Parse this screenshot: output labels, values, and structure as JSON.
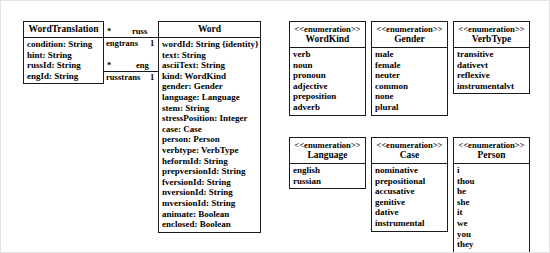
{
  "diagram": {
    "classes": [
      {
        "key": "word_translation",
        "name": "WordTranslation",
        "stereotype": "",
        "attributes": [
          "condition: String",
          "hint: String",
          "russId: String",
          "engId: String"
        ]
      },
      {
        "key": "word",
        "name": "Word",
        "stereotype": "",
        "attributes": [
          "wordId: String {identity}",
          "text: String",
          "asciiText: String",
          "kind: WordKind",
          "gender: Gender",
          "language: Language",
          "stem: String",
          "stressPosition: Integer",
          "case: Case",
          "person: Person",
          "verbtype: VerbType",
          "heformId: String",
          "prepversionId: String",
          "fversionId: String",
          "nversionId: String",
          "mversionId: String",
          "animate: Boolean",
          "enclosed: Boolean"
        ]
      }
    ],
    "enumerations": [
      {
        "key": "wordkind",
        "stereotype": "<<enumeration>>",
        "name": "WordKind",
        "literals": [
          "verb",
          "noun",
          "pronoun",
          "adjective",
          "preposition",
          "adverb"
        ]
      },
      {
        "key": "gender",
        "stereotype": "<<enumeration>>",
        "name": "Gender",
        "literals": [
          "male",
          "female",
          "neuter",
          "common",
          "none",
          "plural"
        ]
      },
      {
        "key": "verbtype",
        "stereotype": "<<enumeration>>",
        "name": "VerbType",
        "literals": [
          "transitive",
          "dativevt",
          "reflexive",
          "instrumentalvt"
        ]
      },
      {
        "key": "language",
        "stereotype": "<<enumeration>>",
        "name": "Language",
        "literals": [
          "english",
          "russian"
        ]
      },
      {
        "key": "case",
        "stereotype": "<<enumeration>>",
        "name": "Case",
        "literals": [
          "nominative",
          "prepositional",
          "accusative",
          "genitive",
          "dative",
          "instrumental"
        ]
      },
      {
        "key": "person",
        "stereotype": "<<enumeration>>",
        "name": "Person",
        "literals": [
          "i",
          "thou",
          "he",
          "she",
          "it",
          "we",
          "you",
          "they"
        ]
      }
    ],
    "associations": [
      {
        "key": "engtrans",
        "source_multiplicity": "*",
        "source_role": "engtrans",
        "target_role": "russ",
        "target_multiplicity": "1"
      },
      {
        "key": "russtrans",
        "source_multiplicity": "*",
        "source_role": "russtrans",
        "target_role": "eng",
        "target_multiplicity": "1"
      }
    ],
    "colors": {
      "line": "#1a1a1a",
      "background": "#ffffff",
      "text": "#000000",
      "page_border": "#e2e2e2"
    }
  }
}
